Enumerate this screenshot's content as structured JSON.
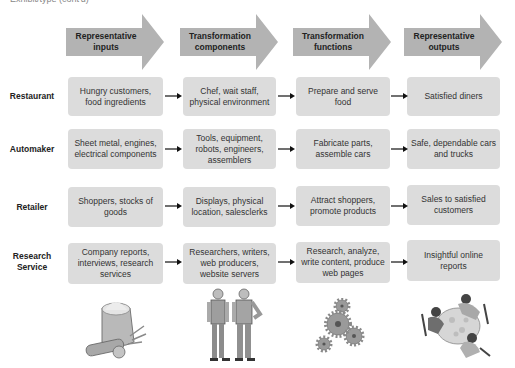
{
  "caption": "Exhibit/type (cont'd)",
  "columns": [
    {
      "label_line1": "Representative",
      "label_line2": "inputs"
    },
    {
      "label_line1": "Transformation",
      "label_line2": "components"
    },
    {
      "label_line1": "Transformation",
      "label_line2": "functions"
    },
    {
      "label_line1": "Representative",
      "label_line2": "outputs"
    }
  ],
  "rows": [
    {
      "label_line1": "Restaurant",
      "label_line2": "",
      "cells": [
        {
          "l1": "Hungry customers,",
          "l2": "food ingredients",
          "l3": ""
        },
        {
          "l1": "Chef, wait staff,",
          "l2": "physical environment",
          "l3": ""
        },
        {
          "l1": "Prepare and serve",
          "l2": "food",
          "l3": ""
        },
        {
          "l1": "Satisfied diners",
          "l2": "",
          "l3": ""
        }
      ]
    },
    {
      "label_line1": "Automaker",
      "label_line2": "",
      "cells": [
        {
          "l1": "Sheet metal, engines,",
          "l2": "electrical components",
          "l3": ""
        },
        {
          "l1": "Tools, equipment,",
          "l2": "robots, engineers,",
          "l3": "assemblers"
        },
        {
          "l1": "Fabricate parts,",
          "l2": "assemble cars",
          "l3": ""
        },
        {
          "l1": "Safe, dependable cars",
          "l2": "and trucks",
          "l3": ""
        }
      ]
    },
    {
      "label_line1": "Retailer",
      "label_line2": "",
      "cells": [
        {
          "l1": "Shoppers, stocks of",
          "l2": "goods",
          "l3": ""
        },
        {
          "l1": "Displays, physical",
          "l2": "location, salesclerks",
          "l3": ""
        },
        {
          "l1": "Attract shoppers,",
          "l2": "promote products",
          "l3": ""
        },
        {
          "l1": "Sales to satisfied",
          "l2": "customers",
          "l3": ""
        }
      ]
    },
    {
      "label_line1": "Research",
      "label_line2": "Service",
      "cells": [
        {
          "l1": "Company reports,",
          "l2": "interviews, research",
          "l3": "services"
        },
        {
          "l1": "Researchers, writers,",
          "l2": "web producers,",
          "l3": "website servers"
        },
        {
          "l1": "Research, analyze,",
          "l2": "write content, produce",
          "l3": "web pages"
        },
        {
          "l1": "Insightful online",
          "l2": "reports",
          "l3": ""
        }
      ]
    }
  ],
  "illustrations": [
    {
      "name": "sack-of-ingredients"
    },
    {
      "name": "construction-workers"
    },
    {
      "name": "gears"
    },
    {
      "name": "diners-at-table"
    }
  ],
  "colors": {
    "header_arrow": "#b3b3b3",
    "box_fill": "#dcdcdc",
    "text": "#222222"
  }
}
